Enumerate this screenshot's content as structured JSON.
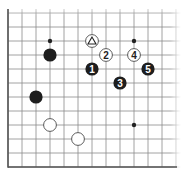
{
  "diagram": {
    "type": "go-board-fragment",
    "grid": {
      "origin_x": 8,
      "bottom_y": 167,
      "spacing": 14,
      "columns": 13,
      "rows": 12,
      "left_edge": true,
      "bottom_edge": true,
      "top_edge": false,
      "right_edge": false,
      "line_color": "#8a8a8a",
      "edge_color": "#555555"
    },
    "star_points": [
      {
        "col": 3,
        "row": 9
      },
      {
        "col": 9,
        "row": 9
      },
      {
        "col": 9,
        "row": 3
      }
    ],
    "stones": [
      {
        "color": "black",
        "col": 3,
        "row": 8,
        "label": ""
      },
      {
        "color": "black",
        "col": 2,
        "row": 5,
        "label": ""
      },
      {
        "color": "white",
        "col": 3,
        "row": 3,
        "label": ""
      },
      {
        "color": "white",
        "col": 5,
        "row": 2,
        "label": ""
      },
      {
        "color": "white",
        "col": 6,
        "row": 9,
        "label": "△",
        "marker": "triangle"
      },
      {
        "color": "black",
        "col": 6,
        "row": 7,
        "label": "1"
      },
      {
        "color": "white",
        "col": 7,
        "row": 8,
        "label": "2"
      },
      {
        "color": "black",
        "col": 8,
        "row": 6,
        "label": "3"
      },
      {
        "color": "white",
        "col": 9,
        "row": 8,
        "label": "4"
      },
      {
        "color": "black",
        "col": 10,
        "row": 7,
        "label": "5"
      }
    ]
  }
}
